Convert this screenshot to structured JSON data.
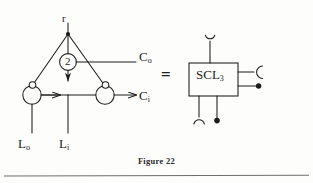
{
  "figure": {
    "caption": "Figure 22",
    "equals_sign": "=",
    "left_diagram": {
      "apex_label": "r",
      "center_node_label": "2",
      "output_top_label": "C",
      "output_top_subscript": "o",
      "output_bottom_label": "C",
      "output_bottom_subscript": "i",
      "input_left_label": "L",
      "input_left_subscript": "o",
      "input_right_label": "L",
      "input_right_subscript": "i"
    },
    "right_diagram": {
      "box_label": "SCL",
      "box_subscript": "3",
      "terminals": [
        {
          "name": "top-cup-terminal",
          "glyph": "cup"
        },
        {
          "name": "right-arc-terminal",
          "glyph": "arc-right"
        },
        {
          "name": "right-dot-terminal",
          "glyph": "filled-dot"
        },
        {
          "name": "bottom-arc-terminal",
          "glyph": "arc-up"
        },
        {
          "name": "bottom-dot-terminal",
          "glyph": "filled-dot"
        }
      ]
    },
    "colors": {
      "stroke": "#1c1c1c",
      "background": "#fdfdfc",
      "rule": "#6e6e6e"
    }
  }
}
